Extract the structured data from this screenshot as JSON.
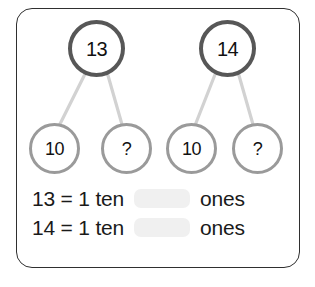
{
  "worksheet": {
    "title": "Number bonds to make teen numbers",
    "frame_color": "#2f2f2f",
    "background": "#ffffff"
  },
  "bonds": [
    {
      "name": "bond-13",
      "whole": "13",
      "whole_color": "#575757",
      "parts": [
        {
          "name": "part-ten",
          "label": "10"
        },
        {
          "name": "part-unknown",
          "label": "?"
        }
      ],
      "part_color": "#9a9a9a",
      "connector_color": "#d2d2d2"
    },
    {
      "name": "bond-14",
      "whole": "14",
      "whole_color": "#575757",
      "parts": [
        {
          "name": "part-ten",
          "label": "10"
        },
        {
          "name": "part-unknown",
          "label": "?"
        }
      ],
      "part_color": "#9a9a9a",
      "connector_color": "#d2d2d2"
    }
  ],
  "equations": [
    {
      "name": "equation-13",
      "lead": "13 = 1 ten",
      "blank": "",
      "trail": "ones",
      "blank_color": "#f0f0f0"
    },
    {
      "name": "equation-14",
      "lead": "14 = 1 ten",
      "blank": "",
      "trail": "ones",
      "blank_color": "#f0f0f0"
    }
  ]
}
